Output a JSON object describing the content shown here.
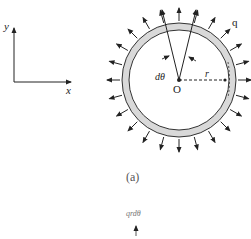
{
  "axes": {
    "x_label": "x",
    "y_label": "y"
  },
  "figure": {
    "center_label": "O",
    "radius_label": "r",
    "angle_label": "dθ",
    "load_label": "q",
    "caption": "(a)",
    "arrow_count": 24
  },
  "inset": {
    "label": "qrdθ"
  },
  "colors": {
    "stroke": "#222222",
    "ring_fill": "#d9d9d9",
    "background": "#ffffff"
  }
}
